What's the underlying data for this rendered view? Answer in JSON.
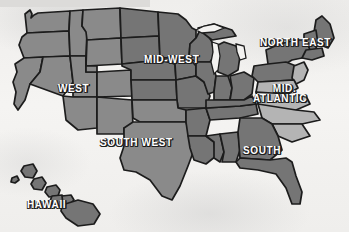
{
  "map": {
    "title": "United States Regions Map",
    "background_color": "#f1f0ee",
    "outline_color": "#1c1c1c",
    "region_fill_dark": "#757575",
    "region_fill_mid": "#8a8a8a",
    "region_fill_light": "#b4b4b4",
    "lake_color": "#f5f4f2",
    "label_text_color": "#ffffff",
    "label_shadow_color": "#1d1d1d",
    "labels": [
      {
        "id": "west",
        "text": "WEST",
        "x": 58,
        "y": 84,
        "font_size": 10,
        "lines": [
          "WEST"
        ]
      },
      {
        "id": "mid-west",
        "text": "MID-WEST",
        "x": 144,
        "y": 55,
        "font_size": 10,
        "lines": [
          "MID-WEST"
        ]
      },
      {
        "id": "north-east",
        "text": "NORTH EAST",
        "x": 260,
        "y": 38,
        "font_size": 10,
        "lines": [
          "NORTH EAST"
        ]
      },
      {
        "id": "mid-atlantic",
        "text": "MID-ATLANTIC",
        "x": 253,
        "y": 85,
        "font_size": 10,
        "lines": [
          "MID.",
          "ATLANTIC"
        ]
      },
      {
        "id": "south-west",
        "text": "SOUTH WEST",
        "x": 100,
        "y": 138,
        "font_size": 10,
        "lines": [
          "SOUTH WEST"
        ]
      },
      {
        "id": "south",
        "text": "SOUTH",
        "x": 243,
        "y": 146,
        "font_size": 10,
        "lines": [
          "SOUTH"
        ]
      },
      {
        "id": "hawaii",
        "text": "HAWAII",
        "x": 27,
        "y": 200,
        "font_size": 10,
        "lines": [
          "HAWAII"
        ]
      }
    ],
    "regions": [
      {
        "id": "west",
        "name": "West",
        "shade": "mid"
      },
      {
        "id": "mid-west",
        "name": "Mid-West",
        "shade": "dark"
      },
      {
        "id": "north-east",
        "name": "North East",
        "shade": "dark"
      },
      {
        "id": "mid-atlantic",
        "name": "Mid-Atlantic",
        "shade": "light"
      },
      {
        "id": "south-west",
        "name": "South West",
        "shade": "mid"
      },
      {
        "id": "south",
        "name": "South",
        "shade": "dark"
      },
      {
        "id": "hawaii",
        "name": "Hawaii",
        "shade": "dark"
      }
    ]
  }
}
